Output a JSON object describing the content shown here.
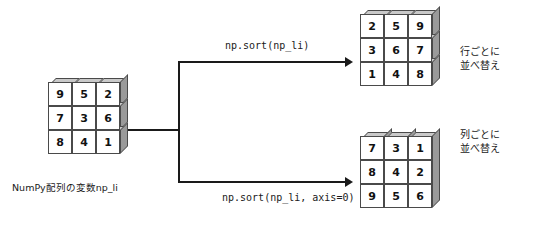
{
  "diagram": {
    "title_caption": "NumPy配列の変数np_li",
    "source_matrix": {
      "name": "np_li",
      "rows": [
        [
          9,
          5,
          2
        ],
        [
          7,
          3,
          6
        ],
        [
          8,
          4,
          1
        ]
      ],
      "shading": "row-slabs"
    },
    "branches": [
      {
        "id": "sort-rows",
        "code_label": "np.sort(np_li)",
        "note_line1": "行ごとに",
        "note_line2": "並べ替え",
        "result_rows": [
          [
            2,
            5,
            9
          ],
          [
            3,
            6,
            7
          ],
          [
            1,
            4,
            8
          ]
        ],
        "shading": "row-slabs"
      },
      {
        "id": "sort-axis0",
        "code_label": "np.sort(np_li, axis=0)",
        "note_line1": "列ごとに",
        "note_line2": "並べ替え",
        "result_rows": [
          [
            7,
            3,
            1
          ],
          [
            8,
            4,
            2
          ],
          [
            9,
            5,
            6
          ]
        ],
        "shading": "column-slabs"
      }
    ],
    "colors": {
      "background": "#ffffff",
      "cell_face": "#ffffff",
      "top_face": "#c9c9c9",
      "side_face": "#9a9a9a",
      "stroke": "#4a4a4a",
      "line": "#1a1a1a",
      "text": "#1a1a1a"
    }
  }
}
